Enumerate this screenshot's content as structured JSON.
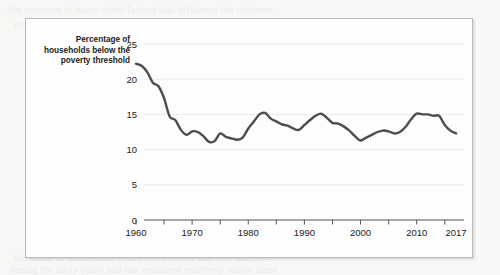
{
  "figure": {
    "axis_title": "Percentage of households below the poverty threshold",
    "background_page_text": {
      "line_a": "the presence of many other factors that influence the outcome",
      "line_b": "poverty threshold. Figure 1 displays the percentage of households",
      "line_c": "over the period. The data are drawn from the Current",
      "line_d": "THE POVERTY RATE",
      "line_e": "the share of households below the poverty line fell sharply",
      "line_f": "during the early years and has remained relatively stable since"
    }
  },
  "chart_data": {
    "type": "line",
    "title": "",
    "subtitle": "",
    "xlabel": "",
    "ylabel": "Percentage of households below the poverty threshold",
    "xlim": [
      1960,
      2017
    ],
    "ylim": [
      0,
      25
    ],
    "yticks": [
      0,
      5,
      10,
      15,
      20,
      25
    ],
    "ytick_labels": [
      "0",
      "5",
      "10",
      "15",
      "20",
      "25"
    ],
    "xticks": [
      1960,
      1965,
      1970,
      1975,
      1980,
      1985,
      1990,
      1995,
      2000,
      2005,
      2010,
      2015
    ],
    "xtick_labels": [
      "1960",
      "",
      "1970",
      "",
      "1980",
      "",
      "1990",
      "",
      "2000",
      "",
      "2010",
      ""
    ],
    "xtick_extra_labels": [
      {
        "x": 2017,
        "label": "2017"
      }
    ],
    "grid": "horizontal",
    "legend": "none",
    "line_color": "#4d4d4d",
    "line_width": 2.4,
    "grid_color": "#e9e9e9",
    "axis_color": "#555555",
    "x": [
      1960,
      1961,
      1962,
      1963,
      1964,
      1965,
      1966,
      1967,
      1968,
      1969,
      1970,
      1971,
      1972,
      1973,
      1974,
      1975,
      1976,
      1977,
      1978,
      1979,
      1980,
      1981,
      1982,
      1983,
      1984,
      1985,
      1986,
      1987,
      1988,
      1989,
      1990,
      1991,
      1992,
      1993,
      1994,
      1995,
      1996,
      1997,
      1998,
      1999,
      2000,
      2001,
      2002,
      2003,
      2004,
      2005,
      2006,
      2007,
      2008,
      2009,
      2010,
      2011,
      2012,
      2013,
      2014,
      2015,
      2016,
      2017
    ],
    "values": [
      22.2,
      21.9,
      21.0,
      19.5,
      19.0,
      17.3,
      14.7,
      14.2,
      12.8,
      12.1,
      12.6,
      12.5,
      11.9,
      11.1,
      11.2,
      12.3,
      11.8,
      11.6,
      11.4,
      11.7,
      13.0,
      14.0,
      15.0,
      15.2,
      14.4,
      14.0,
      13.6,
      13.4,
      13.0,
      12.8,
      13.5,
      14.2,
      14.8,
      15.1,
      14.5,
      13.8,
      13.7,
      13.3,
      12.7,
      11.9,
      11.3,
      11.7,
      12.1,
      12.5,
      12.7,
      12.6,
      12.3,
      12.5,
      13.2,
      14.3,
      15.1,
      15.0,
      15.0,
      14.8,
      14.8,
      13.5,
      12.7,
      12.3
    ]
  }
}
